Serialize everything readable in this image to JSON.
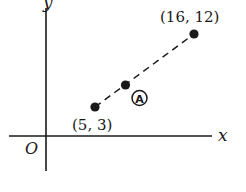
{
  "diagram": {
    "type": "coordinate-plane",
    "axes": {
      "x_label": "x",
      "y_label": "y",
      "origin_label": "O"
    },
    "points": [
      {
        "id": "P1",
        "label": "(5, 3)",
        "x": 5,
        "y": 3
      },
      {
        "id": "A",
        "label": "A",
        "circled": true
      },
      {
        "id": "P2",
        "label": "(16, 12)",
        "x": 16,
        "y": 12
      }
    ],
    "segment": {
      "from": "P1",
      "to": "P2",
      "style": "dashed"
    },
    "colors": {
      "ink": "#1a1a1a",
      "background": "#ffffff"
    }
  }
}
